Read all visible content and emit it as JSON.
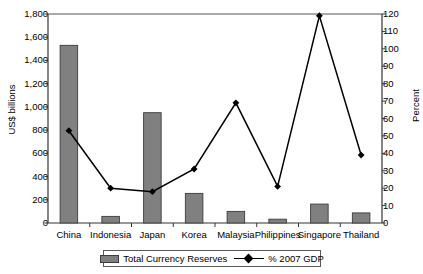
{
  "chart_data": {
    "type": "bar",
    "title": "",
    "subtitle": "",
    "xlabel": "",
    "ylabel": "US$ billions",
    "y2label": "Percent",
    "grid": false,
    "legend_position": "bottom",
    "categories": [
      "China",
      "Indonesia",
      "Japan",
      "Korea",
      "Malaysia",
      "Philippines",
      "Singapore",
      "Thailand"
    ],
    "ylim": [
      0,
      1800
    ],
    "ytick_labels": [
      "0",
      "200",
      "400",
      "600",
      "800",
      "1,000",
      "1,200",
      "1,400",
      "1,600",
      "1,800"
    ],
    "ytick_values": [
      0,
      200,
      400,
      600,
      800,
      1000,
      1200,
      1400,
      1600,
      1800
    ],
    "y2lim": [
      0,
      120
    ],
    "y2tick_labels": [
      "0",
      "10",
      "20",
      "30",
      "40",
      "50",
      "60",
      "70",
      "80",
      "90",
      "100",
      "110",
      "120"
    ],
    "y2tick_values": [
      0,
      10,
      20,
      30,
      40,
      50,
      60,
      70,
      80,
      90,
      100,
      110,
      120
    ],
    "series": [
      {
        "name": "Total Currency Reserves",
        "kind": "bar",
        "axis": "left",
        "unit": "US$ billions",
        "color": "#808080",
        "edge_color": "#3c3c3c",
        "values": [
          1530,
          57,
          950,
          255,
          100,
          33,
          163,
          87
        ]
      },
      {
        "name": "% 2007 GDP",
        "kind": "line",
        "axis": "right",
        "unit": "percent",
        "color": "#000000",
        "marker": "diamond",
        "values": [
          53,
          20,
          18,
          31,
          69,
          21,
          119,
          39
        ]
      }
    ]
  },
  "legend": {
    "items": [
      {
        "label": "Total Currency Reserves",
        "type": "bar"
      },
      {
        "label": "% 2007 GDP",
        "type": "line"
      }
    ]
  },
  "axes": {
    "left_title": "US$ billions",
    "right_title": "Percent"
  }
}
